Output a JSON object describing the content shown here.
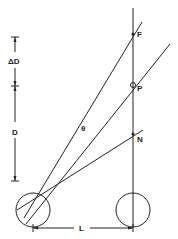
{
  "diagram": {
    "labels": {
      "F": "F",
      "P": "P",
      "N": "N",
      "theta": "θ",
      "delta_d": "ΔD",
      "d": "D",
      "l": "L"
    },
    "colors": {
      "line": "#222222",
      "background": "#ffffff"
    }
  }
}
